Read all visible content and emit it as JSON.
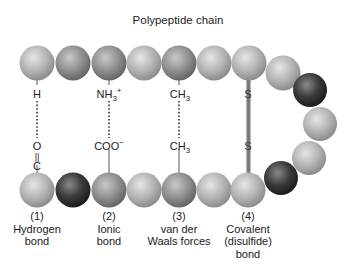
{
  "title": "Polypeptide chain",
  "bonds": [
    {
      "number": "(1)",
      "name_line1": "Hydrogen",
      "name_line2": "bond",
      "name_line3": "",
      "top_atom": "H",
      "bottom_atom_1": "O",
      "bottom_atom_2": "C",
      "connector": "dotted"
    },
    {
      "number": "(2)",
      "name_line1": "Ionic",
      "name_line2": "bond",
      "name_line3": "",
      "top_atom": "NH",
      "top_sub": "3",
      "top_sup": "+",
      "bottom_atom": "COO",
      "bottom_sup": "−",
      "connector": "dotted"
    },
    {
      "number": "(3)",
      "name_line1": "van der",
      "name_line2": "Waals forces",
      "name_line3": "",
      "top_atom": "CH",
      "top_sub": "3",
      "bottom_atom": "CH",
      "bottom_sub": "3",
      "connector": "dotted"
    },
    {
      "number": "(4)",
      "name_line1": "Covalent",
      "name_line2": "(disulfide)",
      "name_line3": "bond",
      "top_atom": "S",
      "bottom_atom": "S",
      "connector": "solid-bar"
    }
  ],
  "colors": {
    "background": "#ffffff",
    "sphere_light": "#b8b8b8",
    "sphere_mid": "#8f8f8f",
    "sphere_dark": "#3a3a3a",
    "bar": "#7a7a7a",
    "text": "#222222"
  }
}
